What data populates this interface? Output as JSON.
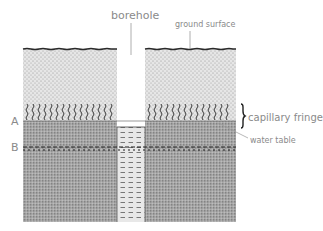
{
  "diagram": {
    "title": "",
    "labels": {
      "borehole": "borehole",
      "ground_surface": "ground surface",
      "capillary_fringe": "capillary fringe",
      "water_table": "water table",
      "level_a": "A",
      "level_b": "B"
    },
    "zones": [
      {
        "name": "unsaturated zone",
        "fill": "light stipple"
      },
      {
        "name": "capillary fringe",
        "fill": "wavy lines on stipple"
      },
      {
        "name": "saturated zone",
        "fill": "dark stipple"
      },
      {
        "name": "borehole water",
        "fill": "dashed horizontal lines"
      }
    ],
    "colors": {
      "light_stipple_bg": "#e4e4e4",
      "dark_stipple_bg": "#a9a9a9",
      "line": "#3a3a3a",
      "label": "#8a8a8a"
    }
  }
}
